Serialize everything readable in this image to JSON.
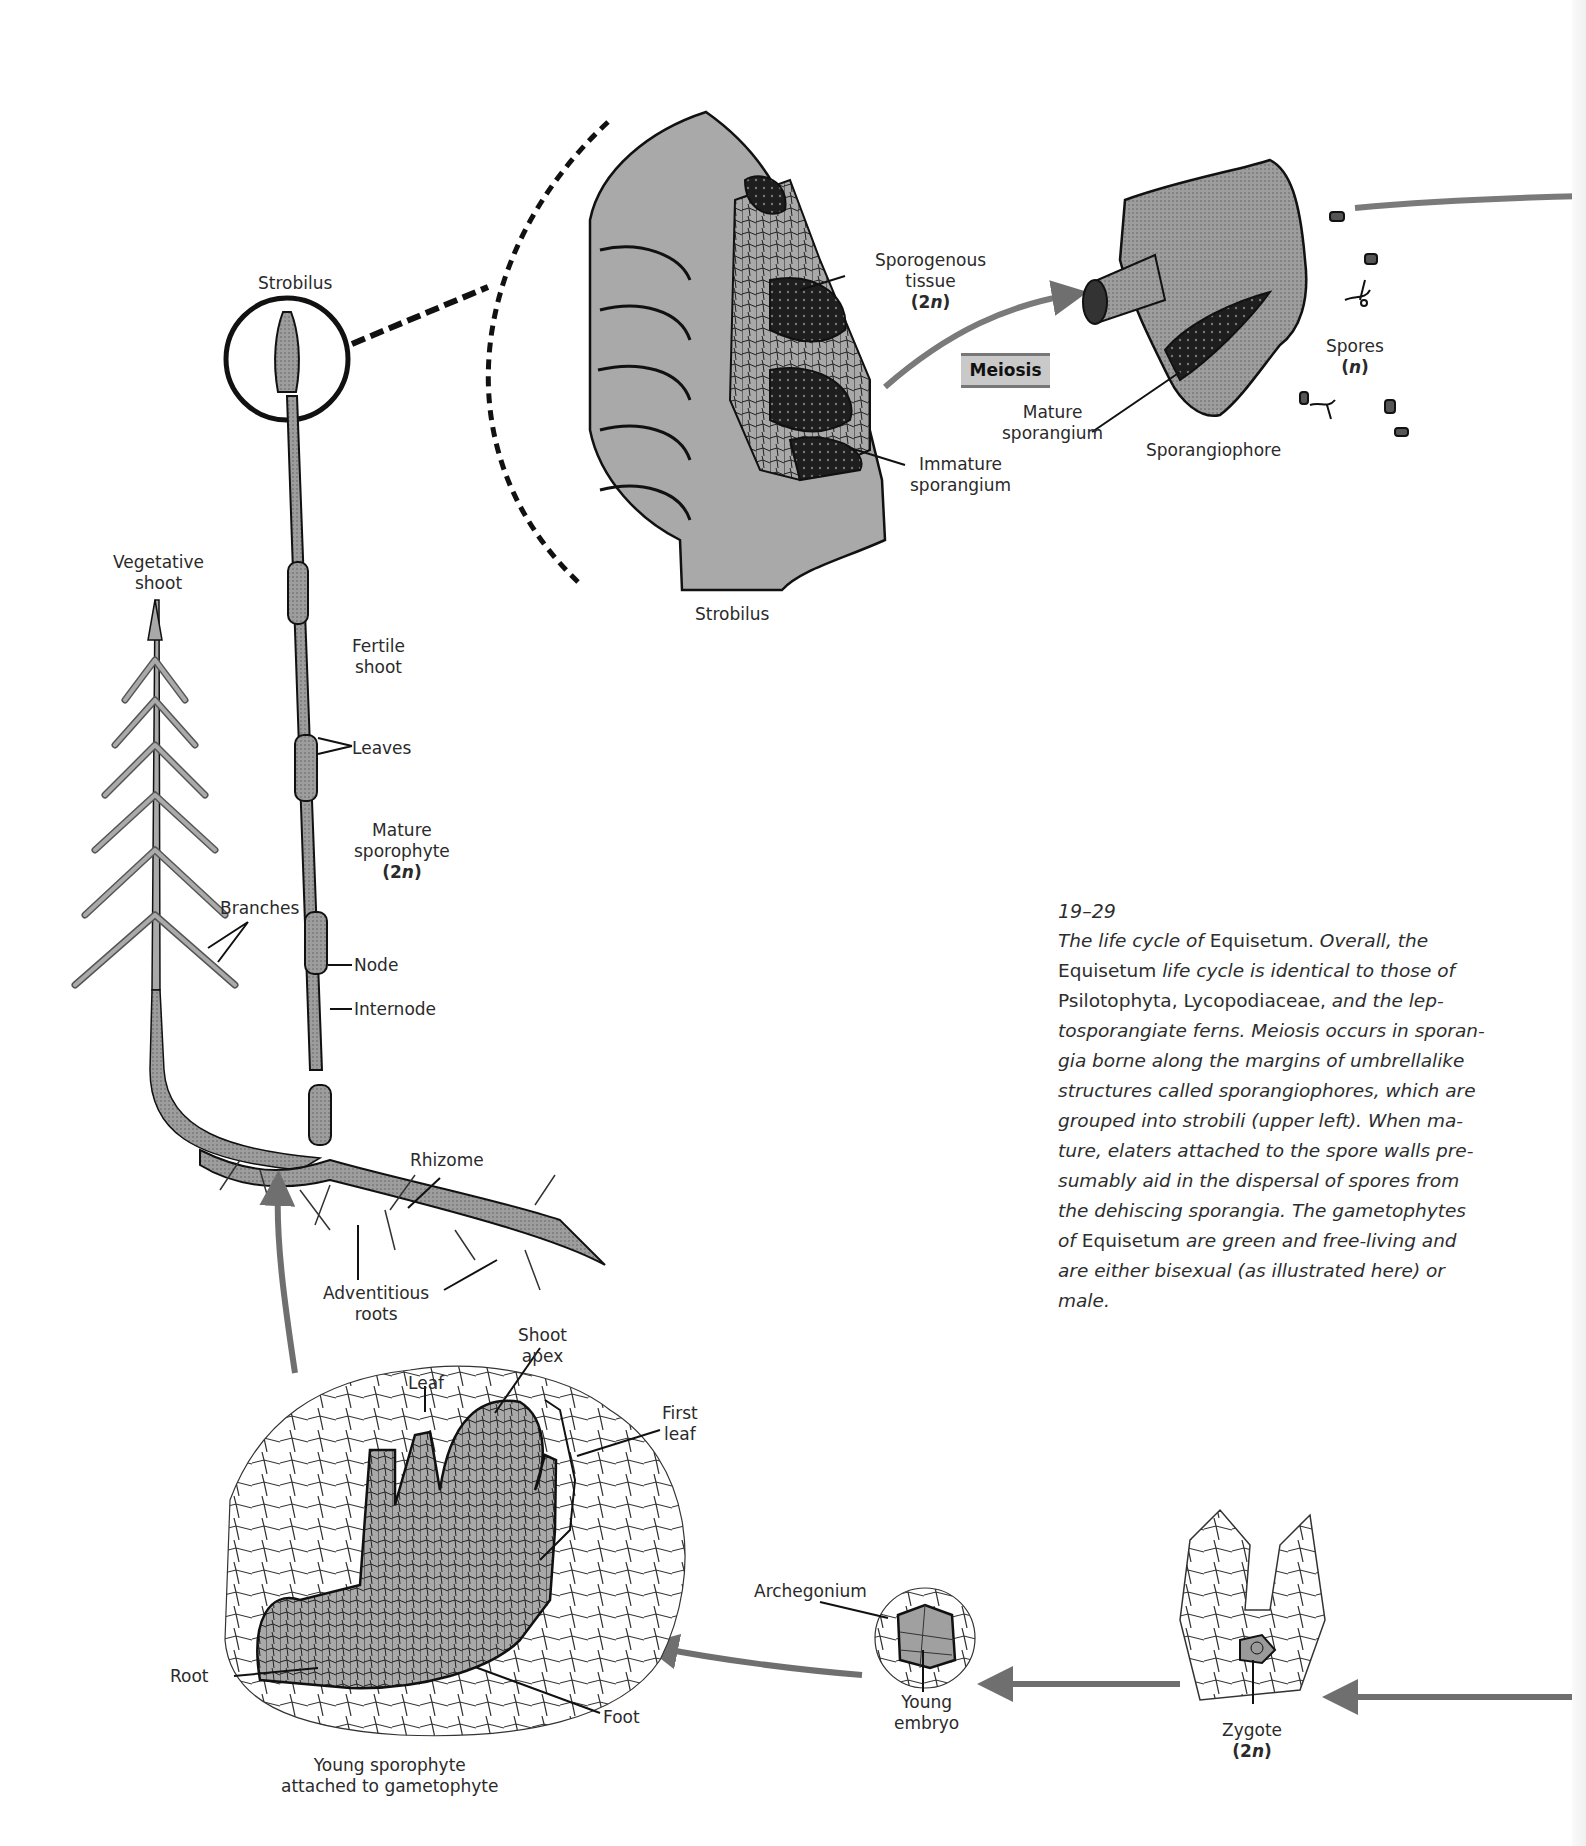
{
  "figure": {
    "number": "19–29",
    "title": "The life cycle of Equisetum"
  },
  "caption": {
    "number": "19–29",
    "segments": [
      {
        "text": "The life cycle of ",
        "italic": true
      },
      {
        "text": "Equisetum",
        "italic": false
      },
      {
        "text": ". ",
        "italic": false
      },
      {
        "text": "Overall, the ",
        "italic": true
      },
      {
        "text": "Equisetum",
        "italic": false
      },
      {
        "text": " life cycle is identical to those of ",
        "italic": true
      },
      {
        "text": "Psilotophyta, Lycopodiaceae,",
        "italic": false
      },
      {
        "text": " and the lep­tosporangiate ferns. Meiosis occurs in sporan­gia borne along the margins of umbrellalike structures called sporangiophores, which are grouped into strobili (upper left). When ma­ture, elaters attached to the spore walls pre­sumably aid in the dispersal of spores from the dehiscing sporangia. The gametophytes of ",
        "italic": true
      },
      {
        "text": "Equisetum",
        "italic": false
      },
      {
        "text": " are green and free-living and are either bisexual (as illustrated here) or male.",
        "italic": true
      }
    ]
  },
  "process_box": {
    "label": "Meiosis"
  },
  "labels": {
    "strobilus_top": "Strobilus",
    "vegetative_shoot": [
      "Vegetative",
      "shoot"
    ],
    "fertile_shoot": [
      "Fertile",
      "shoot"
    ],
    "leaves": "Leaves",
    "mature_sporophyte": [
      "Mature",
      "sporophyte",
      "(2n)"
    ],
    "branches": "Branches",
    "node": "Node",
    "internode": "Internode",
    "rhizome": "Rhizome",
    "adventitious_roots": [
      "Adventitious",
      "roots"
    ],
    "strobilus_section": "Strobilus",
    "sporogenous_tissue": [
      "Sporogenous",
      "tissue",
      "(2n)"
    ],
    "immature_sporangium": [
      "Immature",
      "sporangium"
    ],
    "mature_sporangium": [
      "Mature",
      "sporangium"
    ],
    "sporangiophore": "Sporangiophore",
    "spores": [
      "Spores",
      "(n)"
    ],
    "shoot_apex": [
      "Shoot",
      "apex"
    ],
    "leaf": "Leaf",
    "first_leaf": [
      "First",
      "leaf"
    ],
    "root": "Root",
    "foot": "Foot",
    "young_sporophyte": [
      "Young sporophyte",
      "attached to gametophyte"
    ],
    "archegonium": "Archegonium",
    "young_embryo": [
      "Young",
      "embryo"
    ],
    "zygote": [
      "Zygote",
      "(2n)"
    ]
  },
  "colors": {
    "tissue_gray": "#a9a9a9",
    "dark_tissue": "#1e1e1e",
    "arrow_gray": "#6f6f6f",
    "line": "#111111",
    "meiosis_box": "#c9c9c9"
  }
}
